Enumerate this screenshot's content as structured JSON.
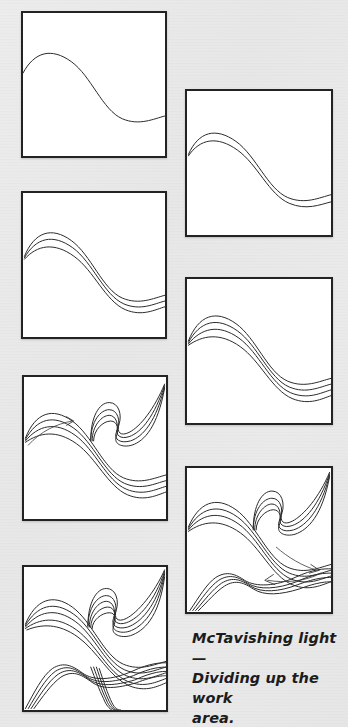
{
  "page": {
    "width": 348,
    "height": 727,
    "background_color": "#e9e9e9",
    "panel_background": "#ffffff",
    "panel_border_color": "#232323",
    "ink_color": "#2b2b2b"
  },
  "caption": {
    "line1": "McTavishing light —",
    "line2": "Dividing up the work",
    "line3": "area.",
    "full_text": "McTavishing light — Dividing up the work area."
  },
  "panels": [
    {
      "index": 1,
      "label": "step-1",
      "x": 21,
      "y": 11,
      "w": 146,
      "h": 147,
      "description": "single S-curve spine",
      "curve_count": 1,
      "has_arrow": false
    },
    {
      "index": 2,
      "label": "step-2",
      "x": 185,
      "y": 89,
      "w": 148,
      "h": 148,
      "description": "two parallel S-curves",
      "curve_count": 2,
      "has_arrow": false
    },
    {
      "index": 3,
      "label": "step-3",
      "x": 21,
      "y": 191,
      "w": 146,
      "h": 148,
      "description": "three parallel S-curves",
      "curve_count": 3,
      "has_arrow": false
    },
    {
      "index": 4,
      "label": "step-4",
      "x": 185,
      "y": 277,
      "w": 148,
      "h": 148,
      "description": "four parallel S-curves",
      "curve_count": 4,
      "has_arrow": false
    },
    {
      "index": 5,
      "label": "step-5",
      "x": 22,
      "y": 375,
      "w": 146,
      "h": 146,
      "description": "S-curve bundle plus upper-right echo bundle, rightward arrow",
      "curve_count": 4,
      "has_arrow": true
    },
    {
      "index": 6,
      "label": "step-6",
      "x": 185,
      "y": 466,
      "w": 148,
      "h": 148,
      "description": "S-curve bundle, upper-right echo bundle, lower-left bundle, two arrows",
      "curve_count": 4,
      "has_arrow": true
    },
    {
      "index": 7,
      "label": "step-7",
      "x": 22,
      "y": 565,
      "w": 146,
      "h": 147,
      "description": "completed division: three bundles filling the square",
      "curve_count": 5,
      "has_arrow": false
    }
  ],
  "chart_data": {
    "type": "line",
    "title": "McTavishing light — Dividing up the work area.",
    "grid": false,
    "legend": "none",
    "xlim": [
      0,
      100
    ],
    "ylim": [
      0,
      100
    ]
  }
}
